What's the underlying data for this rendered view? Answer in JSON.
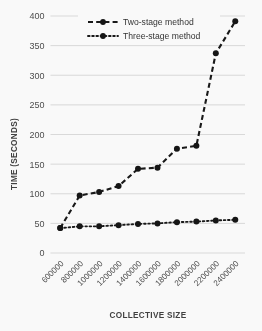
{
  "chart_data": {
    "type": "line",
    "title": "",
    "xlabel": "COLLECTIVE SIZE",
    "ylabel": "TIME (SECONDS)",
    "categories": [
      "600000",
      "800000",
      "1000000",
      "1200000",
      "1400000",
      "1600000",
      "1800000",
      "2000000",
      "2200000",
      "2400000"
    ],
    "x": [
      600000,
      800000,
      1000000,
      1200000,
      1400000,
      1600000,
      1800000,
      2000000,
      2200000,
      2400000
    ],
    "ylim": [
      0,
      400
    ],
    "yticks": [
      0,
      50,
      100,
      150,
      200,
      250,
      300,
      350,
      400
    ],
    "ytick_labels": [
      "0",
      "50",
      "100",
      "150",
      "200",
      "250",
      "300",
      "350",
      "400"
    ],
    "grid": "horizontal",
    "legend_position": "top-center",
    "series": [
      {
        "name": "Two-stage method",
        "line_style": "dashed",
        "marker": "circle",
        "color": "#111111",
        "values": [
          42,
          97,
          103,
          113,
          142,
          144,
          176,
          181,
          337,
          391
        ]
      },
      {
        "name": "Three-stage method",
        "line_style": "dotted",
        "marker": "circle",
        "color": "#111111",
        "values": [
          42,
          45,
          45,
          47,
          49,
          50,
          52,
          53,
          55,
          56
        ]
      }
    ]
  },
  "legend": {
    "entries": [
      {
        "label": "Two-stage method"
      },
      {
        "label": "Three-stage method"
      }
    ]
  },
  "axes": {
    "y_title": "TIME (SECONDS)",
    "x_title": "COLLECTIVE SIZE"
  }
}
